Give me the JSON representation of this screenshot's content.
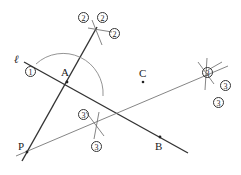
{
  "diagram": {
    "points": {
      "A": "A",
      "B": "B",
      "C": "C",
      "P": "P"
    },
    "line_label": "ℓ",
    "step_markers": {
      "one": "1",
      "two_a": "2",
      "two_b": "2",
      "two_c": "2",
      "three_a": "3",
      "three_b": "3",
      "three_c": "3",
      "three_d": "3",
      "three_e": "3"
    },
    "colors": {
      "line": "#333333",
      "thin": "#777777"
    }
  }
}
